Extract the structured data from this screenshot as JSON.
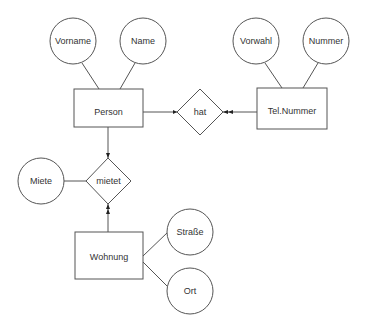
{
  "diagram": {
    "type": "entity-relationship",
    "entities": [
      {
        "id": "person",
        "label": "Person"
      },
      {
        "id": "telnummer",
        "label": "Tel.Nummer"
      },
      {
        "id": "wohnung",
        "label": "Wohnung"
      }
    ],
    "relationships": [
      {
        "id": "hat",
        "label": "hat"
      },
      {
        "id": "mietet",
        "label": "mietet"
      }
    ],
    "attributes": [
      {
        "id": "vorname",
        "label": "Vorname",
        "of": "person"
      },
      {
        "id": "name",
        "label": "Name",
        "of": "person"
      },
      {
        "id": "vorwahl",
        "label": "Vorwahl",
        "of": "telnummer"
      },
      {
        "id": "nummer",
        "label": "Nummer",
        "of": "telnummer"
      },
      {
        "id": "miete",
        "label": "Miete",
        "of": "mietet"
      },
      {
        "id": "strasse",
        "label": "Straße",
        "of": "wohnung"
      },
      {
        "id": "ort",
        "label": "Ort",
        "of": "wohnung"
      }
    ],
    "edges": [
      {
        "from": "person",
        "to": "hat",
        "arrow": "single"
      },
      {
        "from": "telnummer",
        "to": "hat",
        "arrow": "double"
      },
      {
        "from": "person",
        "to": "mietet",
        "arrow": "single"
      },
      {
        "from": "wohnung",
        "to": "mietet",
        "arrow": "double"
      }
    ]
  },
  "labels": {
    "person": "Person",
    "telnummer": "Tel.Nummer",
    "wohnung": "Wohnung",
    "hat": "hat",
    "mietet": "mietet",
    "vorname": "Vorname",
    "name": "Name",
    "vorwahl": "Vorwahl",
    "nummer": "Nummer",
    "miete": "Miete",
    "strasse": "Straße",
    "ort": "Ort"
  }
}
